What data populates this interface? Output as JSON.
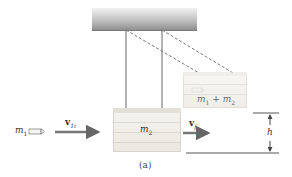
{
  "figure": {
    "caption": "(a)",
    "ceiling": {
      "name": "support"
    },
    "bullet": {
      "mass_label": "m",
      "mass_sub": "1"
    },
    "block": {
      "mass_label": "m",
      "mass_sub": "2"
    },
    "combined_block": {
      "label_a": "m",
      "label_a_sub": "1",
      "plus": " + ",
      "label_b": "m",
      "label_b_sub": "2"
    },
    "initial_velocity": {
      "label": "v",
      "sub": "1i"
    },
    "final_velocity": {
      "label": "v",
      "sub": "f"
    },
    "height": {
      "label": "h"
    }
  },
  "colors": {
    "line": "#555555",
    "dashed": "#777777",
    "arrow": "#666666",
    "background": "#ffffff"
  }
}
